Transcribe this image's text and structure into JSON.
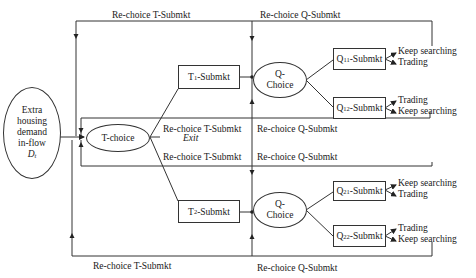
{
  "diagram": {
    "source": {
      "lines": [
        "Extra",
        "housing",
        "demand",
        "in-flow"
      ],
      "symbol": "D",
      "symbol_sub": "t"
    },
    "t_choice": {
      "label": "T-choice"
    },
    "exit_label": "Exit",
    "t_submarkets": [
      {
        "prefix": "T",
        "sub": "1",
        "suffix": "-Submkt"
      },
      {
        "prefix": "T",
        "sub": "2",
        "suffix": "-Submkt"
      }
    ],
    "q_choices": [
      {
        "line1": "Q-",
        "line2": "Choice"
      },
      {
        "line1": "Q-",
        "line2": "Choice"
      }
    ],
    "q_submarkets": [
      {
        "prefix": "Q",
        "sub": "11",
        "suffix": "-Submkt",
        "outcomes": [
          "Keep searching",
          "Trading"
        ]
      },
      {
        "prefix": "Q",
        "sub": "12",
        "suffix": "-Submkt",
        "outcomes": [
          "Trading",
          "Keep searching"
        ]
      },
      {
        "prefix": "Q",
        "sub": "21",
        "suffix": "-Submkt",
        "outcomes": [
          "Keep searching",
          "Trading"
        ]
      },
      {
        "prefix": "Q",
        "sub": "22",
        "suffix": "-Submkt",
        "outcomes": [
          "Trading",
          "Keep searching"
        ]
      }
    ],
    "loop_labels": {
      "top_t": "Re-choice T-Submkt",
      "top_q": "Re-choice Q-Submkt",
      "inner_top_t": "Re-choice T-Submkt",
      "inner_top_q": "Re-choice Q-Submkt",
      "inner_bottom_t": "Re-choice T-Submkt",
      "inner_bottom_q": "Re-choice Q-Submkt",
      "bottom_t": "Re-choice T-Submkt",
      "bottom_q": "Re-choice Q-Submkt"
    }
  }
}
